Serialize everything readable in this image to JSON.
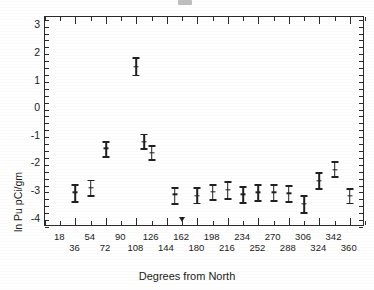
{
  "figure": {
    "title_partial": "",
    "background": "#ffffff",
    "ink_color": "#202020"
  },
  "axis": {
    "y_title": "ln Pu pCi/gm",
    "x_title": "Degrees from North",
    "y_ticks": [
      "3",
      "2",
      "1",
      "0",
      "-1",
      "-2",
      "-3",
      "-4"
    ],
    "x_ticks_row0": [
      "18",
      "54",
      "90",
      "126",
      "162",
      "198",
      "234",
      "270",
      "306",
      "342"
    ],
    "x_ticks_row1": [
      "36",
      "72",
      "108",
      "144",
      "180",
      "216",
      "252",
      "288",
      "324",
      "360"
    ]
  },
  "chart_data": {
    "type": "scatter",
    "title": "",
    "xlabel": "Degrees from North",
    "ylabel": "ln Pu pCi/gm",
    "xlim": [
      0,
      378
    ],
    "ylim": [
      -4.3,
      3.3
    ],
    "grid": false,
    "legend": false,
    "error_bars": "vertical, capped (mean +/- uncertainty)",
    "x_major_tick_step": 36,
    "x_minor_tick_step": 18,
    "y_major_tick_step": 1,
    "y_minor_tick_step": 0.25,
    "points": [
      {
        "x": 36,
        "y": -3.05,
        "ylow": -3.4,
        "yhigh": -2.78
      },
      {
        "x": 54,
        "y": -2.88,
        "ylow": -3.18,
        "yhigh": -2.62
      },
      {
        "x": 72,
        "y": -1.45,
        "ylow": -1.78,
        "yhigh": -1.22
      },
      {
        "x": 108,
        "y": 1.5,
        "ylow": 1.18,
        "yhigh": 1.82
      },
      {
        "x": 117,
        "y": -1.22,
        "ylow": -1.48,
        "yhigh": -0.95
      },
      {
        "x": 126,
        "y": -1.62,
        "ylow": -1.88,
        "yhigh": -1.38
      },
      {
        "x": 153,
        "y": -3.12,
        "ylow": -3.48,
        "yhigh": -2.88
      },
      {
        "x": 162,
        "y": -4.05,
        "ylow": -4.05,
        "yhigh": -4.05,
        "censored": true
      },
      {
        "x": 180,
        "y": -3.18,
        "ylow": -3.45,
        "yhigh": -2.9
      },
      {
        "x": 198,
        "y": -3.02,
        "ylow": -3.32,
        "yhigh": -2.78
      },
      {
        "x": 216,
        "y": -2.95,
        "ylow": -3.28,
        "yhigh": -2.68
      },
      {
        "x": 234,
        "y": -3.12,
        "ylow": -3.42,
        "yhigh": -2.85
      },
      {
        "x": 252,
        "y": -3.05,
        "ylow": -3.35,
        "yhigh": -2.78
      },
      {
        "x": 270,
        "y": -3.05,
        "ylow": -3.35,
        "yhigh": -2.78
      },
      {
        "x": 288,
        "y": -3.08,
        "ylow": -3.4,
        "yhigh": -2.82
      },
      {
        "x": 306,
        "y": -3.45,
        "ylow": -3.8,
        "yhigh": -3.18
      },
      {
        "x": 324,
        "y": -2.62,
        "ylow": -2.92,
        "yhigh": -2.35
      },
      {
        "x": 342,
        "y": -2.22,
        "ylow": -2.48,
        "yhigh": -1.95
      },
      {
        "x": 360,
        "y": -3.18,
        "ylow": -3.45,
        "yhigh": -2.92
      }
    ]
  }
}
